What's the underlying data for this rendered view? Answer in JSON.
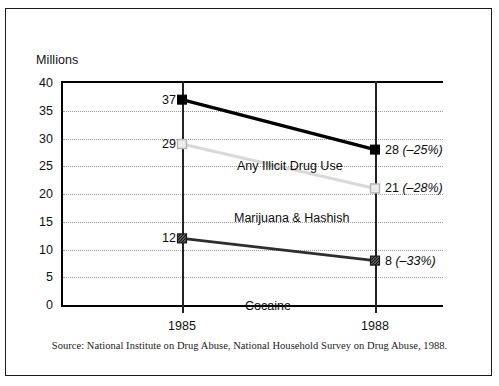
{
  "source_note": "Source: National Institute on Drug Abuse, National Household Survey on Drug Abuse, 1988.",
  "chart_data": {
    "type": "line",
    "title": "",
    "subtitle": "",
    "xlabel": "",
    "ylabel": "Millions",
    "ylim": [
      0,
      40
    ],
    "y_ticks": [
      "0",
      "5",
      "10",
      "15",
      "20",
      "25",
      "30",
      "35",
      "40"
    ],
    "grid": true,
    "grid_style": "dotted-horizontal",
    "legend_position": "inline-labels",
    "categories": [
      "1985",
      "1988"
    ],
    "x_tick_labels": [
      "1985",
      "1988"
    ],
    "series": [
      {
        "name": "Any Illicit Drug Use",
        "values": [
          37,
          28
        ],
        "start_label": "37",
        "end_value_label": "28",
        "end_pct_label": "(–25%)",
        "change_pct": -25,
        "color": "#000000",
        "marker": "filled-square",
        "marker_fill": "#000000",
        "line_width": 3.2,
        "label_x_px": 176,
        "label_y_px": 78
      },
      {
        "name": "Marijuana & Hashish",
        "values": [
          29,
          21
        ],
        "start_label": "29",
        "end_value_label": "21",
        "end_pct_label": "(–28%)",
        "change_pct": -28,
        "color": "#d9d9d9",
        "marker": "open-square",
        "marker_fill": "#ececec",
        "line_width": 3.2,
        "label_x_px": 173,
        "label_y_px": 130
      },
      {
        "name": "Cocaine",
        "values": [
          12,
          8
        ],
        "start_label": "12",
        "end_value_label": "8",
        "end_pct_label": "(–33%)",
        "change_pct": -33,
        "color": "#2e2e2e",
        "marker": "hatched-square",
        "marker_fill": "#4a4a4a",
        "line_width": 2.6,
        "label_x_px": 184,
        "label_y_px": 218
      }
    ]
  }
}
